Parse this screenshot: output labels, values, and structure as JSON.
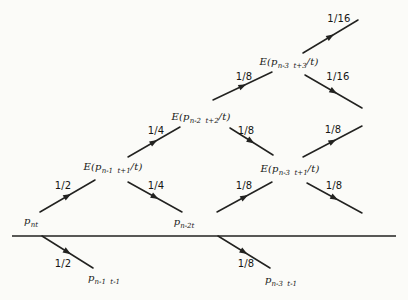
{
  "figure": {
    "width": 408,
    "height": 300,
    "colors": {
      "background": "#fbfbf8",
      "line": "#222220",
      "text": "#161614"
    }
  },
  "axis": {
    "x1": 12,
    "y1": 236,
    "x2": 396,
    "y2": 236
  },
  "nodes": [
    {
      "id": "p-nt",
      "pre": "p",
      "sub": "nt",
      "post": "",
      "x": 31,
      "y": 221
    },
    {
      "id": "p-n2t",
      "pre": "p",
      "sub": "n-2t",
      "post": "",
      "x": 184,
      "y": 222
    },
    {
      "id": "e-pn1-t1",
      "pre": "E(p",
      "sub": "n-1  t+1",
      "post": "/t)",
      "x": 113,
      "y": 167
    },
    {
      "id": "e-pn2-t2",
      "pre": "E(p",
      "sub": "n-2  t+2",
      "post": "/t)",
      "x": 201,
      "y": 117
    },
    {
      "id": "e-pn3-t3",
      "pre": "E(p",
      "sub": "n-3  t+3",
      "post": "/t)",
      "x": 289,
      "y": 62
    },
    {
      "id": "e-pn3-t1",
      "pre": "E(p",
      "sub": "n-3  t+1",
      "post": "/t)",
      "x": 290,
      "y": 169
    },
    {
      "id": "p-n1-tminus1",
      "pre": "p",
      "sub": "n-1  t-1",
      "post": "",
      "x": 104,
      "y": 278
    },
    {
      "id": "p-n3-tminus1",
      "pre": "p",
      "sub": "n-3  t-1",
      "post": "",
      "x": 281,
      "y": 280
    }
  ],
  "edges": [
    {
      "id": "pnt-to-epn1",
      "x1": 40,
      "y1": 212,
      "x2": 95,
      "y2": 180,
      "label": "1/2",
      "lx": 63,
      "ly": 186
    },
    {
      "id": "epn1-to-epn2",
      "x1": 128,
      "y1": 157,
      "x2": 180,
      "y2": 127,
      "label": "1/4",
      "lx": 156,
      "ly": 131
    },
    {
      "id": "epn1-to-pn2t",
      "x1": 128,
      "y1": 182,
      "x2": 182,
      "y2": 212,
      "label": "1/4",
      "lx": 156,
      "ly": 186
    },
    {
      "id": "epn2-to-epn3t3",
      "x1": 213,
      "y1": 100,
      "x2": 272,
      "y2": 72,
      "label": "1/8",
      "lx": 244,
      "ly": 77
    },
    {
      "id": "epn2-to-epn3t1",
      "x1": 230,
      "y1": 128,
      "x2": 273,
      "y2": 155,
      "label": "1/8",
      "lx": 246,
      "ly": 131
    },
    {
      "id": "pn2t-to-epn3t1",
      "x1": 217,
      "y1": 212,
      "x2": 272,
      "y2": 182,
      "label": "1/8",
      "lx": 244,
      "ly": 186
    },
    {
      "id": "epn3t3-up",
      "x1": 303,
      "y1": 53,
      "x2": 358,
      "y2": 20,
      "label": "1/16",
      "lx": 339,
      "ly": 19
    },
    {
      "id": "epn3t3-down",
      "x1": 305,
      "y1": 75,
      "x2": 362,
      "y2": 108,
      "label": "1/16",
      "lx": 338,
      "ly": 77
    },
    {
      "id": "epn3t1-up",
      "x1": 303,
      "y1": 157,
      "x2": 362,
      "y2": 126,
      "label": "1/8",
      "lx": 333,
      "ly": 130
    },
    {
      "id": "epn3t1-down",
      "x1": 307,
      "y1": 183,
      "x2": 362,
      "y2": 213,
      "label": "1/8",
      "lx": 334,
      "ly": 186
    },
    {
      "id": "axis-to-pn1-tminus1",
      "x1": 42,
      "y1": 236,
      "x2": 93,
      "y2": 268,
      "label": "1/2",
      "lx": 63,
      "ly": 264
    },
    {
      "id": "axis-to-pn3-tminus1",
      "x1": 218,
      "y1": 236,
      "x2": 270,
      "y2": 268,
      "label": "1/8",
      "lx": 246,
      "ly": 264
    }
  ]
}
